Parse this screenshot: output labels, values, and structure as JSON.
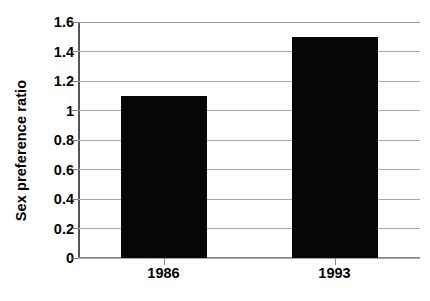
{
  "chart_data": {
    "type": "bar",
    "title": "",
    "xlabel": "",
    "ylabel": "Sex preference ratio",
    "categories": [
      "1986",
      "1993"
    ],
    "values": [
      1.1,
      1.5
    ],
    "series": [
      {
        "name": "Sex preference ratio",
        "values": [
          1.1,
          1.5
        ]
      }
    ],
    "ylim": [
      0,
      1.6
    ],
    "ytick_labels": [
      "0",
      "0.2",
      "0.4",
      "0.6",
      "0.8",
      "1",
      "1.2",
      "1.4",
      "1.6"
    ],
    "ytick_values": [
      0,
      0.2,
      0.4,
      0.6,
      0.8,
      1,
      1.2,
      1.4,
      1.6
    ],
    "grid": true,
    "grid_axis": "y",
    "legend": false,
    "legend_position": "none",
    "bar_color": "#060606",
    "grid_color": "#a8a8a8",
    "axis_color": "#555555",
    "background_color": "#ffffff"
  }
}
